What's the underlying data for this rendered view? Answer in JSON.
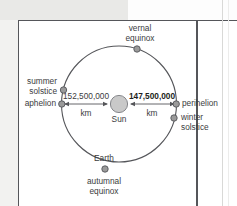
{
  "figure": {
    "center_body": {
      "name": "Sun",
      "label": "Sun",
      "color": "#c9c9c9"
    },
    "orbiting_body": {
      "name": "Earth",
      "label": "Earth"
    },
    "orbit_points": [
      {
        "id": "vernal-equinox",
        "label_line1": "vernal",
        "label_line2": "equinox",
        "position": "top"
      },
      {
        "id": "summer-solstice",
        "label_line1": "summer",
        "label_line2": "solstice",
        "position": "upper-left"
      },
      {
        "id": "aphelion",
        "label_line1": "aphelion",
        "label_line2": "",
        "position": "left"
      },
      {
        "id": "perihelion",
        "label_line1": "perihelion",
        "label_line2": "",
        "position": "right"
      },
      {
        "id": "winter-solstice",
        "label_line1": "winter",
        "label_line2": "solstice",
        "position": "lower-right"
      },
      {
        "id": "autumnal-equinox",
        "label_line1": "autumnal",
        "label_line2": "equinox",
        "position": "bottom"
      }
    ],
    "distances": [
      {
        "id": "aphelion-distance",
        "value": "152,500,000",
        "unit": "km",
        "side": "left",
        "emphasis": "normal"
      },
      {
        "id": "perihelion-distance",
        "value": "147,500,000",
        "unit": "km",
        "side": "right",
        "emphasis": "bold"
      }
    ],
    "colors": {
      "orbit_line": "#55565a",
      "node": "#9a9a9a",
      "node_stroke": "#55565a",
      "text": "#3b3c40",
      "panel_border": "#55565a",
      "page_background": "#f2f2f0",
      "panel_background": "#ffffff"
    }
  }
}
